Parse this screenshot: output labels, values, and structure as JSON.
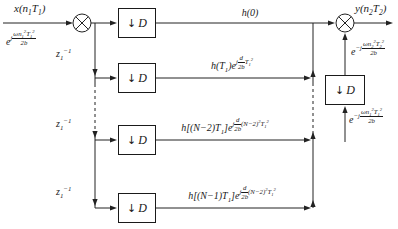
{
  "diagram": {
    "title_hint": "chirp-transform-decimation-filter-bank",
    "input": {
      "signal": "x(n_{1}T_{1})",
      "chirp": "e^{j\\frac{ωn_{1}^{2}T_{1}^{2}}{2b}}"
    },
    "delays": {
      "labels": [
        "z_{1}^{−1}",
        "z_{1}^{−1}",
        "z_{1}^{−1}"
      ]
    },
    "decimator": {
      "arrow": "↓",
      "letter": "D"
    },
    "branches": [
      {
        "gain": "h(0)"
      },
      {
        "gain": "h(T_{1})e^{j\\frac{d}{2b}T_{1}^{2}}"
      },
      {
        "gain": "h[(N−2)T_{1}]e^{j\\frac{d}{2b}(N−2)^{2}T_{1}^{2}}"
      },
      {
        "gain": "h[(N−1)T_{1}]e^{j\\frac{d}{2b}(N−2)^{2}T_{1}^{2}}"
      }
    ],
    "output": {
      "signal": "y(n_{2}T_{2})",
      "chirp_after_decimation": "e^{−j\\frac{ωn_{2}^{2}T_{2}^{2}}{2b}}",
      "chirp_before_decimation": "e^{−j\\frac{ωn_{1}^{2}T_{1}^{2}}{2b}}"
    },
    "colors": {
      "line": "#222222",
      "text": "#1a1a1a",
      "background": "#ffffff"
    }
  }
}
